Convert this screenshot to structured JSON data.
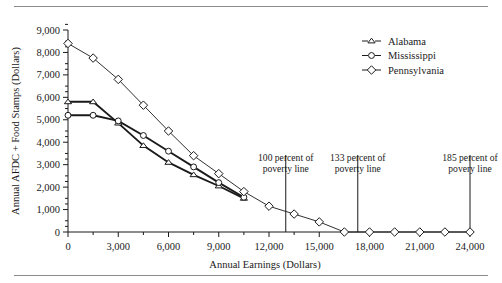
{
  "chart_data": {
    "type": "line",
    "title": "",
    "xlabel": "Annual Earnings (Dollars)",
    "ylabel": "Annual AFDC + Food Stamps (Dollars)",
    "xlim": [
      0,
      24000
    ],
    "ylim": [
      0,
      9000
    ],
    "xticks": [
      0,
      3000,
      6000,
      9000,
      12000,
      15000,
      18000,
      21000,
      24000
    ],
    "xtick_labels": [
      "0",
      "3,000",
      "6,000",
      "9,000",
      "12,000",
      "15,000",
      "18,000",
      "21,000",
      "24,000"
    ],
    "xtick_minor_step": 1500,
    "yticks": [
      0,
      1000,
      2000,
      3000,
      4000,
      5000,
      6000,
      7000,
      8000,
      9000
    ],
    "ytick_labels": [
      "0",
      "1,000",
      "2,000",
      "3,000",
      "4,000",
      "5,000",
      "6,000",
      "7,000",
      "8,000",
      "9,000"
    ],
    "grid": false,
    "legend_position": "top-right",
    "series": [
      {
        "name": "Alabama",
        "marker": "triangle",
        "x": [
          0,
          1500,
          3000,
          4500,
          6000,
          7500,
          9000,
          10500
        ],
        "values": [
          5800,
          5800,
          4850,
          3850,
          3100,
          2550,
          2050,
          1500
        ]
      },
      {
        "name": "Mississippi",
        "marker": "circle",
        "x": [
          0,
          1500,
          3000,
          4500,
          6000,
          7500,
          9000,
          10500
        ],
        "values": [
          5200,
          5200,
          4950,
          4300,
          3600,
          2900,
          2200,
          1550
        ]
      },
      {
        "name": "Pennsylvania",
        "marker": "diamond",
        "x": [
          0,
          1500,
          3000,
          4500,
          6000,
          7500,
          9000,
          10500,
          12000,
          13500,
          15000,
          16500,
          18000,
          19500,
          21000,
          22500,
          24000
        ],
        "values": [
          8400,
          7750,
          6800,
          5650,
          4500,
          3400,
          2600,
          1800,
          1150,
          800,
          450,
          0,
          0,
          0,
          0,
          0,
          0
        ]
      }
    ],
    "annotations": [
      {
        "id": "poverty-100",
        "x": 13000,
        "lines": [
          "100 percent of",
          "poverty line"
        ]
      },
      {
        "id": "poverty-133",
        "x": 17300,
        "lines": [
          "133 percent of",
          "poverty line"
        ]
      },
      {
        "id": "poverty-185",
        "x": 24000,
        "lines": [
          "185 percent of",
          "povery line"
        ]
      }
    ]
  },
  "colors": {
    "ink": "#1a1a1a",
    "rule": "#8c8c8c",
    "marker_fill": "#ffffff",
    "background": "#ffffff"
  }
}
